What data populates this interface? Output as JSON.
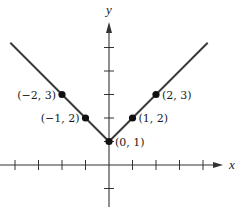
{
  "chart_data": {
    "type": "line",
    "title": "",
    "function": "y = |x| + 1",
    "xlabel": "x",
    "ylabel": "y",
    "xlim": [
      -4.6,
      4.9
    ],
    "ylim": [
      -1.8,
      6.6
    ],
    "grid": false,
    "x_ticks": [
      -4,
      -3,
      -2,
      -1,
      1,
      2,
      3,
      4
    ],
    "y_ticks": [
      -1,
      1,
      2,
      3,
      4,
      5
    ],
    "series": [
      {
        "name": "y = |x| + 1",
        "x": [
          -4.2,
          0,
          4.2
        ],
        "y": [
          5.2,
          1,
          5.2
        ],
        "color": "#3a3a3a"
      }
    ],
    "points": [
      {
        "x": -2,
        "y": 3,
        "label": "(−2, 3)",
        "label_side": "left"
      },
      {
        "x": -1,
        "y": 2,
        "label": "(−1, 2)",
        "label_side": "left"
      },
      {
        "x": 0,
        "y": 1,
        "label": "(0, 1)",
        "label_side": "right"
      },
      {
        "x": 1,
        "y": 2,
        "label": "(1, 2)",
        "label_side": "right"
      },
      {
        "x": 2,
        "y": 3,
        "label": "(2, 3)",
        "label_side": "right"
      }
    ],
    "colors": {
      "line": "#3a3a3a",
      "axis": "#333333",
      "point": "#111111"
    }
  }
}
